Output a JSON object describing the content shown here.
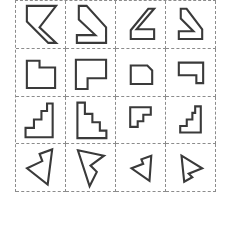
{
  "style": {
    "background_color": "#ffffff",
    "cell_border_color": "#8c8c8c",
    "cell_border_style": "dashed",
    "shape_stroke_color": "#3a3a3a",
    "shape_fill_color": "#ffffff"
  },
  "grid": {
    "rows": 4,
    "columns": 4,
    "cell_count": 16,
    "left": 15,
    "top": 0,
    "width": 201,
    "height": 192
  },
  "chart_data": {
    "type": "table",
    "rows": 4,
    "columns": 4,
    "row_labels": [
      "row-1-flag-chevron",
      "row-2-notched-rectangle",
      "row-3-staircase",
      "row-4-arrowhead"
    ],
    "column_labels": [
      "variant-1",
      "variant-2",
      "variant-3",
      "variant-4"
    ],
    "cells": [
      {
        "id": "cell-r1c1",
        "row": 1,
        "col": 1,
        "shape_name": "flag-chevron-left",
        "viewbox": "0 0 50 48",
        "points": "11,5 41,5 24,27 41,43 33,43 11,21",
        "transform": "base"
      },
      {
        "id": "cell-r1c2",
        "row": 1,
        "col": 2,
        "shape_name": "flag-chevron-right",
        "viewbox": "0 0 50 48",
        "points": "13,5 21,5 41,27 41,43 11,43 11,35 30,35 13,19",
        "transform": "rotated"
      },
      {
        "id": "cell-r1c3",
        "row": 1,
        "col": 3,
        "shape_name": "flag-chevron-small-left",
        "viewbox": "0 0 50 48",
        "points": "33,8 39,8 21,29 39,29 39,39 15,39 15,30",
        "transform": "scaled-reflected"
      },
      {
        "id": "cell-r1c4",
        "row": 1,
        "col": 4,
        "shape_name": "flag-chevron-small-right",
        "viewbox": "0 0 50 48",
        "points": "15,8 21,8 37,29 37,39 13,39 13,31 28,31 15,18",
        "transform": "scaled-rotated"
      },
      {
        "id": "cell-r2c1",
        "row": 2,
        "col": 1,
        "shape_name": "notched-rectangle-top-right",
        "viewbox": "0 0 50 48",
        "points": "11,12 24,12 24,19 40,19 40,40 11,40",
        "transform": "base"
      },
      {
        "id": "cell-r2c2",
        "row": 2,
        "col": 2,
        "shape_name": "notched-rectangle-bottom-left",
        "viewbox": "0 0 50 48",
        "points": "10,11 41,11 41,30 22,30 22,41 10,41",
        "transform": "rotated"
      },
      {
        "id": "cell-r2c3",
        "row": 2,
        "col": 3,
        "shape_name": "notched-rectangle-small-top-right",
        "viewbox": "0 0 50 48",
        "points": "15,17 32,17 37,22 37,36 15,36",
        "transform": "scaled"
      },
      {
        "id": "cell-r2c4",
        "row": 2,
        "col": 4,
        "shape_name": "notched-rectangle-small-bottom-right",
        "viewbox": "0 0 50 48",
        "points": "13,14 38,14 38,35 31,35 31,27 13,27",
        "transform": "scaled-rotated"
      },
      {
        "id": "cell-r3c1",
        "row": 3,
        "col": 1,
        "shape_name": "staircase-ascending-right",
        "viewbox": "0 0 50 50",
        "points": "32,7 38,7 38,43 9,43 9,33 18,33 18,24 26,24 26,15 32,15",
        "transform": "base"
      },
      {
        "id": "cell-r3c2",
        "row": 3,
        "col": 2,
        "shape_name": "staircase-descending-right",
        "viewbox": "0 0 50 50",
        "points": "11,6 19,6 19,18 27,18 27,27 35,27 35,36 42,36 42,44 11,44",
        "transform": "reflected"
      },
      {
        "id": "cell-r3c3",
        "row": 3,
        "col": 3,
        "shape_name": "staircase-small-descending-right",
        "viewbox": "0 0 50 50",
        "points": "14,11 36,11 36,19 28,19 28,26 22,26 22,32 14,32",
        "transform": "scaled"
      },
      {
        "id": "cell-r3c4",
        "row": 3,
        "col": 4,
        "shape_name": "staircase-small-ascending-right",
        "viewbox": "0 0 50 50",
        "points": "30,10 36,10 36,38 14,38 14,31 21,31 21,24 27,24 27,17 30,17",
        "transform": "scaled-reflected"
      },
      {
        "id": "cell-r4c1",
        "row": 4,
        "col": 1,
        "shape_name": "arrowhead-notched-left",
        "viewbox": "0 0 50 52",
        "points": "38,6 33,45 10,27 27,19 24,11",
        "transform": "base"
      },
      {
        "id": "cell-r4c2",
        "row": 4,
        "col": 2,
        "shape_name": "arrowhead-notched-right",
        "viewbox": "0 0 50 52",
        "points": "11,7 40,13 25,24 32,31 24,47",
        "transform": "rotated"
      },
      {
        "id": "cell-r4c3",
        "row": 4,
        "col": 3,
        "shape_name": "arrowhead-small-notched-left",
        "viewbox": "0 0 50 52",
        "points": "37,13 35,41 15,27 28,22 26,17",
        "transform": "scaled"
      },
      {
        "id": "cell-r4c4",
        "row": 4,
        "col": 4,
        "shape_name": "arrowhead-small-notched-right",
        "viewbox": "0 0 50 52",
        "points": "15,13 38,27 23,33 27,37 18,42",
        "transform": "scaled-reflected"
      }
    ]
  }
}
